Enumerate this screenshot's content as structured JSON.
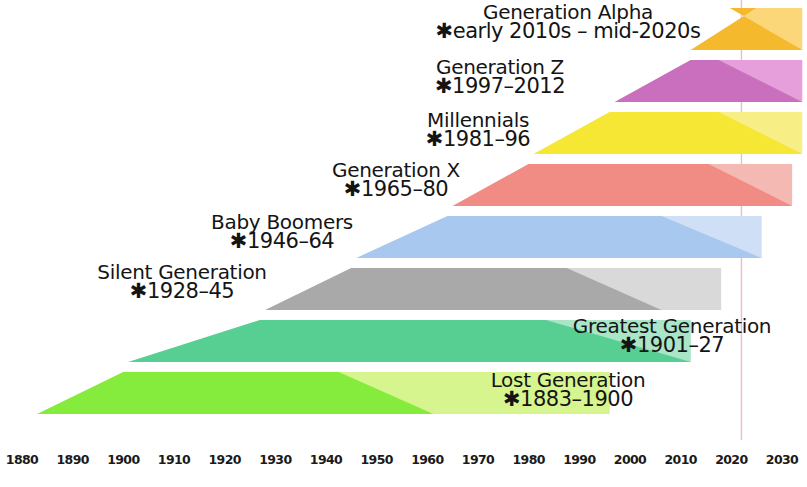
{
  "chart_data": {
    "type": "area",
    "xlabel": "",
    "ylabel": "",
    "xlim": [
      1878,
      2034
    ],
    "grid": false,
    "legend_position": "inline-labels",
    "present_line_year": 2022,
    "x_ticks": [
      1880,
      1890,
      1900,
      1910,
      1920,
      1930,
      1940,
      1950,
      1960,
      1970,
      1980,
      1990,
      2000,
      2010,
      2020,
      2030
    ],
    "x_tick_labels": [
      "1880",
      "1890",
      "1900",
      "1910",
      "1920",
      "1930",
      "1940",
      "1950",
      "1960",
      "1970",
      "1980",
      "1990",
      "2000",
      "2010",
      "2020",
      "2030"
    ],
    "series": [
      {
        "name": "Generation Alpha",
        "years_label": "✱early 2010s – mid-2020s",
        "core_start": 2012,
        "core_end": 2025,
        "span_start": 2012,
        "span_end": 2034,
        "fill_light": "#fbd77a",
        "fill_dark": "#f5b92e",
        "row": 0
      },
      {
        "name": "Generation Z",
        "years_label": "✱1997–2012",
        "core_start": 1997,
        "core_end": 2012,
        "span_start": 1997,
        "span_end": 2034,
        "fill_light": "#e79fdc",
        "fill_dark": "#c96fbd",
        "row": 1
      },
      {
        "name": "Millennials",
        "years_label": "✱1981–96",
        "core_start": 1981,
        "core_end": 1996,
        "span_start": 1981,
        "span_end": 2034,
        "fill_light": "#f7ef86",
        "fill_dark": "#f5e734",
        "row": 2
      },
      {
        "name": "Generation X",
        "years_label": "✱1965–80",
        "core_start": 1965,
        "core_end": 1980,
        "span_start": 1965,
        "span_end": 2032,
        "fill_light": "#f5b9b4",
        "fill_dark": "#f18c84",
        "row": 3
      },
      {
        "name": "Baby Boomers",
        "years_label": "✱1946–64",
        "core_start": 1946,
        "core_end": 1964,
        "span_start": 1946,
        "span_end": 2026,
        "fill_light": "#cfe0f6",
        "fill_dark": "#a8c8ef",
        "row": 4
      },
      {
        "name": "Silent Generation",
        "years_label": "✱1928–45",
        "core_start": 1928,
        "core_end": 1945,
        "span_start": 1928,
        "span_end": 2018,
        "fill_light": "#d9d9d9",
        "fill_dark": "#a9a9a9",
        "row": 5
      },
      {
        "name": "Greatest Generation",
        "years_label": "✱1901–27",
        "core_start": 1901,
        "core_end": 1927,
        "span_start": 1901,
        "span_end": 2012,
        "fill_light": "#a9e5c6",
        "fill_dark": "#57cf93",
        "row": 6
      },
      {
        "name": "Lost Generation",
        "years_label": "✱1883–1900",
        "core_start": 1883,
        "core_end": 1900,
        "span_start": 1883,
        "span_end": 1996,
        "fill_light": "#d6f58e",
        "fill_dark": "#85ec3d",
        "row": 7
      }
    ]
  },
  "label_positions": [
    {
      "cx": 568,
      "top": 2
    },
    {
      "cx": 500,
      "top": 57
    },
    {
      "cx": 478,
      "top": 110
    },
    {
      "cx": 396,
      "top": 160
    },
    {
      "cx": 282,
      "top": 212
    },
    {
      "cx": 182,
      "top": 262
    },
    {
      "cx": 672,
      "top": 316
    },
    {
      "cx": 568,
      "top": 370
    }
  ],
  "axis": {
    "x_start_px": 22,
    "x_end_px": 782
  }
}
